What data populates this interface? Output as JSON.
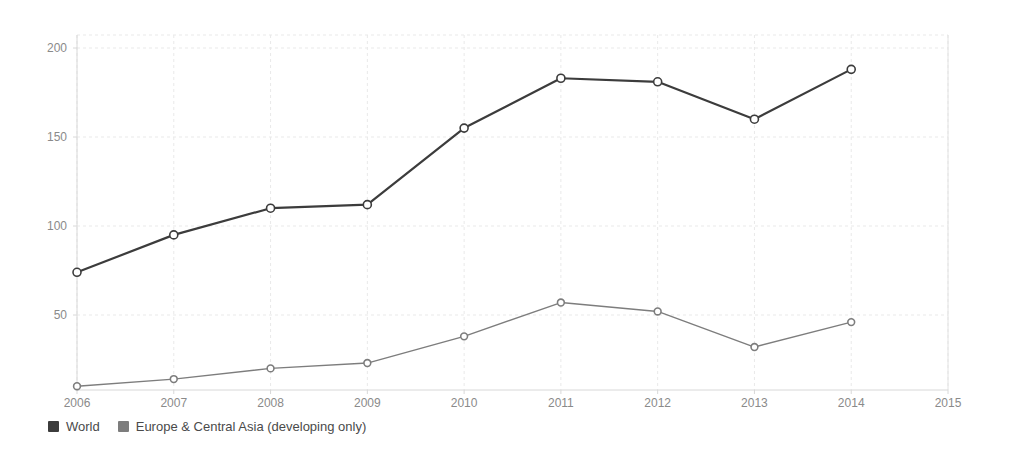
{
  "chart_data": {
    "type": "line",
    "title": "",
    "subtitle": "",
    "xlabel": "",
    "ylabel": "",
    "x": [
      2006,
      2007,
      2008,
      2009,
      2010,
      2011,
      2012,
      2013,
      2014
    ],
    "xtick_labels": [
      "2006",
      "2007",
      "2008",
      "2009",
      "2010",
      "2011",
      "2012",
      "2013",
      "2014",
      "2015"
    ],
    "xtick_values": [
      2006,
      2007,
      2008,
      2009,
      2010,
      2011,
      2012,
      2013,
      2014,
      2015
    ],
    "ytick_labels": [
      "50",
      "100",
      "150",
      "200"
    ],
    "ytick_values": [
      50,
      100,
      150,
      200
    ],
    "xlim": [
      2006,
      2015
    ],
    "ylim": [
      0,
      210
    ],
    "grid": true,
    "legend_position": "bottom-left",
    "series": [
      {
        "name": "World",
        "color": "#3c3c3c",
        "marker": "circle",
        "values": [
          74,
          95,
          110,
          112,
          155,
          183,
          181,
          160,
          188
        ]
      },
      {
        "name": "Europe & Central Asia (developing only)",
        "color": "#7d7d7d",
        "marker": "circle",
        "values": [
          10,
          14,
          20,
          23,
          38,
          57,
          52,
          32,
          46
        ]
      }
    ]
  },
  "legend": {
    "items": [
      {
        "label": "World",
        "color": "#3c3c3c"
      },
      {
        "label": "Europe & Central Asia (developing only)",
        "color": "#7d7d7d"
      }
    ]
  },
  "axes": {
    "y_axis_name": "y-axis",
    "x_axis_name": "x-axis"
  }
}
